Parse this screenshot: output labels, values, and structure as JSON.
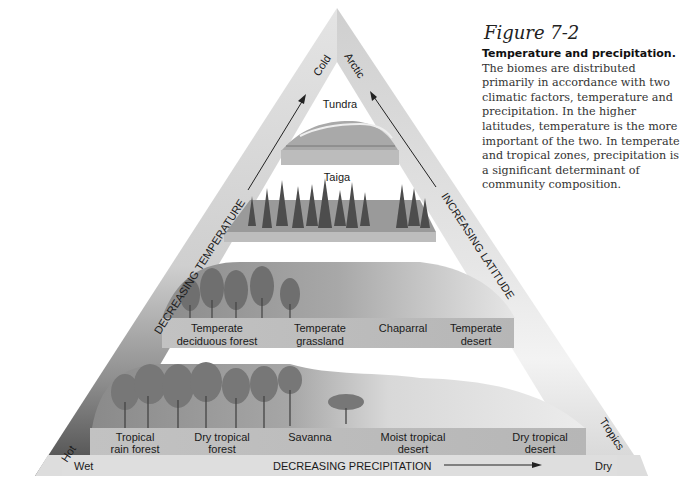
{
  "figure": {
    "number": "Figure 7-2",
    "title_bold": "Temperature and precipitation.",
    "body": " The biomes are distributed primarily in accordance with two climatic factors, temperature and precipitation. In the higher latitudes, temperature is the more important of the two. In temperate and tropical zones, precipitation is a significant determinant of community composition."
  },
  "axes": {
    "left_axis": "DECREASING TEMPERATURE",
    "right_axis": "INCREASING LATITUDE",
    "bottom_axis": "DECREASING PRECIPITATION",
    "apex_left": "Cold",
    "apex_right": "Arctic",
    "bottom_left_corner": "Hot",
    "bottom_right_corner": "Tropics",
    "bottom_left_end": "Wet",
    "bottom_right_end": "Dry"
  },
  "tiers": [
    {
      "name": "tundra",
      "labels": [
        {
          "l1": "Tundra",
          "l2": ""
        }
      ]
    },
    {
      "name": "taiga",
      "labels": [
        {
          "l1": "Taiga",
          "l2": ""
        }
      ]
    },
    {
      "name": "temperate",
      "labels": [
        {
          "l1": "Temperate",
          "l2": "deciduous forest"
        },
        {
          "l1": "Temperate",
          "l2": "grassland"
        },
        {
          "l1": "Chaparral",
          "l2": ""
        },
        {
          "l1": "Temperate",
          "l2": "desert"
        }
      ]
    },
    {
      "name": "tropical",
      "labels": [
        {
          "l1": "Tropical",
          "l2": "rain forest"
        },
        {
          "l1": "Dry tropical",
          "l2": "forest"
        },
        {
          "l1": "Savanna",
          "l2": ""
        },
        {
          "l1": "Moist tropical",
          "l2": "desert"
        },
        {
          "l1": "Dry tropical",
          "l2": "desert"
        }
      ]
    }
  ],
  "colors": {
    "frame_light": "#e2e2e2",
    "frame_dark": "#555555",
    "slab": "#bdbdbd",
    "bar": "#dcdcdc"
  }
}
